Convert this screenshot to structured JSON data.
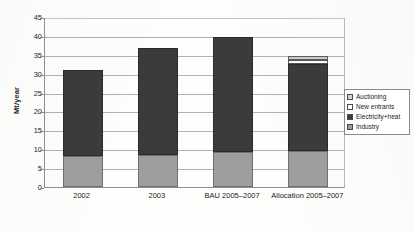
{
  "chart_data": {
    "type": "bar",
    "subtype": "stacked-bar",
    "title": "",
    "xlabel": "",
    "ylabel": "Mt/year",
    "ylim": [
      0,
      45
    ],
    "ytick_step": 5,
    "yticks": [
      0,
      5,
      10,
      15,
      20,
      25,
      30,
      35,
      40,
      45
    ],
    "ytick_labels": [
      "0",
      "5",
      "10",
      "15",
      "20",
      "25",
      "30",
      "35",
      "40",
      "45"
    ],
    "grid": true,
    "grid_axis": "y",
    "legend_position": "inside-top-right",
    "categories": [
      "2002",
      "2003",
      "BAU 2005–2007",
      "Allocation 2005–2007"
    ],
    "stack_order_bottom_to_top": [
      "Industry",
      "Electricity+heat",
      "New entrants",
      "Auctioning"
    ],
    "series": [
      {
        "name": "Industry",
        "color": "#9e9e9e",
        "values": [
          8.2,
          8.5,
          9.3,
          9.5
        ]
      },
      {
        "name": "Electricity+heat",
        "color": "#3b3b3b",
        "values": [
          22.7,
          28.2,
          30.5,
          23.0
        ]
      },
      {
        "name": "New entrants",
        "color": "#fbfbfb",
        "values": [
          0,
          0,
          0,
          1.1
        ]
      },
      {
        "name": "Auctioning",
        "color": "#c8c8c8",
        "values": [
          0,
          0,
          0,
          1.2
        ]
      }
    ],
    "totals": [
      30.9,
      36.7,
      39.8,
      34.8
    ],
    "legend_entries": [
      {
        "label": "Auctioning",
        "color": "#c8c8c8"
      },
      {
        "label": "New entrants",
        "color": "#ffffff"
      },
      {
        "label": "Electricity+heat",
        "color": "#3a3a3a"
      },
      {
        "label": "Industry",
        "color": "#9c9c9c"
      }
    ]
  },
  "axis": {
    "y_title": "Mt/year"
  }
}
